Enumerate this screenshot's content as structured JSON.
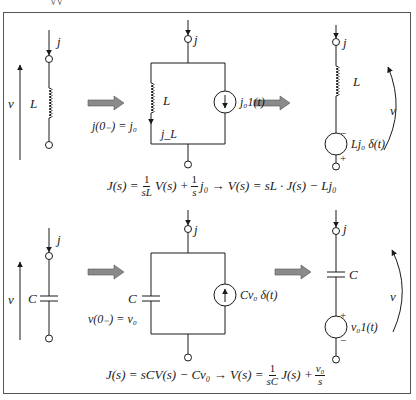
{
  "top_fragment": "√√",
  "inductor_section": {
    "original": {
      "current_label": "j",
      "voltage_label": "v",
      "element_label": "L"
    },
    "parallel_model": {
      "current_label": "j",
      "element_label": "L",
      "initial_condition": "j(0₋) = j₀",
      "branch_current": "j_L",
      "source_label": "j₀1(t)"
    },
    "series_model": {
      "current_label": "j",
      "element_label": "L",
      "voltage_label": "v",
      "source_label": "Lj₀ δ(t)",
      "source_top_sign": "−",
      "source_bottom_sign": "+"
    },
    "equation": {
      "lhs": "J(s) =",
      "frac1_num": "1",
      "frac1_den": "sL",
      "mid1": "V(s) +",
      "frac2_num": "1",
      "frac2_den": "s",
      "mid2": "j₀ → V(s) = sL · J(s) − Lj₀"
    }
  },
  "capacitor_section": {
    "original": {
      "current_label": "j",
      "voltage_label": "v",
      "element_label": "C"
    },
    "parallel_model": {
      "current_label": "j",
      "element_label": "C",
      "initial_condition": "v(0₋) = v₀",
      "source_label": "Cv₀ δ(t)"
    },
    "series_model": {
      "current_label": "j",
      "element_label": "C",
      "voltage_label": "v",
      "source_label": "v₀1(t)",
      "source_top_sign": "+",
      "source_bottom_sign": "−"
    },
    "equation": {
      "lhs": "J(s) = sCV(s) − Cv₀ → V(s) =",
      "frac1_num": "1",
      "frac1_den": "sC",
      "mid1": "J(s) +",
      "frac2_num": "v₀",
      "frac2_den": "s"
    }
  },
  "colors": {
    "line": "#1a1a1a",
    "arrow_fill": "#8a8a8a",
    "frame": "#555555"
  }
}
